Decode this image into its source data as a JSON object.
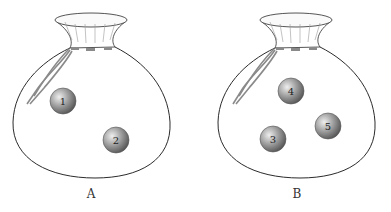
{
  "figure": {
    "bags": [
      {
        "label": "A",
        "balls": [
          {
            "number": "1"
          },
          {
            "number": "2"
          }
        ]
      },
      {
        "label": "B",
        "balls": [
          {
            "number": "4"
          },
          {
            "number": "3"
          },
          {
            "number": "5"
          }
        ]
      }
    ],
    "colors": {
      "outline": "#2b2b2b",
      "ball_dark": "#5e5e5e",
      "ball_light": "#e8e8e8",
      "cord": "#8a8a8a"
    }
  }
}
